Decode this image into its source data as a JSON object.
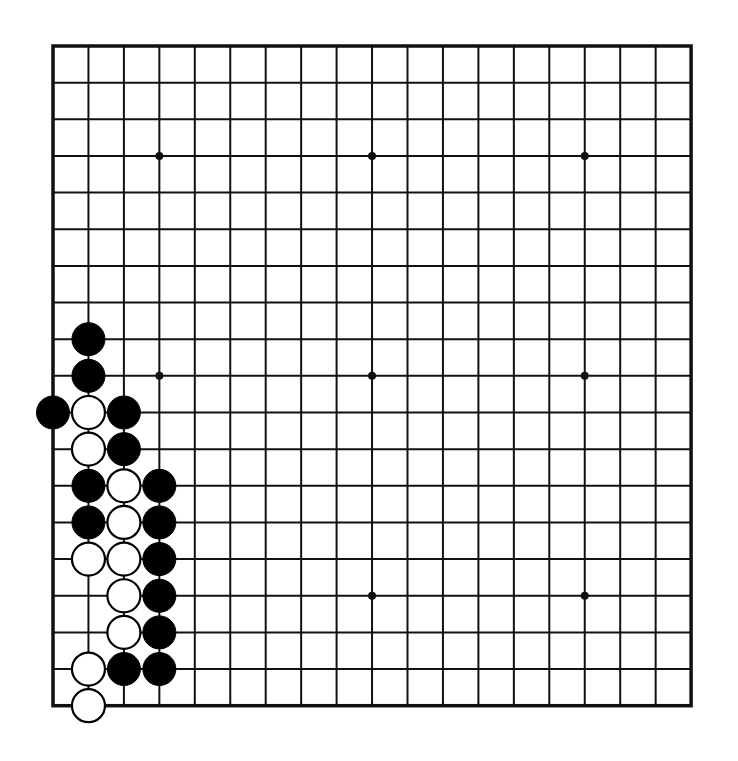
{
  "board": {
    "size": 19,
    "origin_x": 53,
    "origin_y": 46,
    "spacing_x": 35.45,
    "spacing_y": 36.65,
    "background": "#ffffff",
    "line_color": "#111111",
    "edge_width": 3.5,
    "line_width": 2,
    "stone_radius": 16.5,
    "star_radius": 4,
    "star_points": [
      [
        3,
        3
      ],
      [
        9,
        3
      ],
      [
        15,
        3
      ],
      [
        3,
        9
      ],
      [
        9,
        9
      ],
      [
        15,
        9
      ],
      [
        3,
        15
      ],
      [
        9,
        15
      ],
      [
        15,
        15
      ]
    ]
  },
  "stones": [
    {
      "color": "black",
      "col": 1,
      "row": 8
    },
    {
      "color": "black",
      "col": 1,
      "row": 9
    },
    {
      "color": "black",
      "col": 0,
      "row": 10
    },
    {
      "color": "white",
      "col": 1,
      "row": 10
    },
    {
      "color": "black",
      "col": 2,
      "row": 10
    },
    {
      "color": "white",
      "col": 1,
      "row": 11
    },
    {
      "color": "black",
      "col": 2,
      "row": 11
    },
    {
      "color": "black",
      "col": 1,
      "row": 12
    },
    {
      "color": "white",
      "col": 2,
      "row": 12
    },
    {
      "color": "black",
      "col": 3,
      "row": 12
    },
    {
      "color": "black",
      "col": 1,
      "row": 13
    },
    {
      "color": "white",
      "col": 2,
      "row": 13
    },
    {
      "color": "black",
      "col": 3,
      "row": 13
    },
    {
      "color": "white",
      "col": 1,
      "row": 14
    },
    {
      "color": "white",
      "col": 2,
      "row": 14
    },
    {
      "color": "black",
      "col": 3,
      "row": 14
    },
    {
      "color": "white",
      "col": 2,
      "row": 15
    },
    {
      "color": "black",
      "col": 3,
      "row": 15
    },
    {
      "color": "white",
      "col": 2,
      "row": 16
    },
    {
      "color": "black",
      "col": 3,
      "row": 16
    },
    {
      "color": "white",
      "col": 1,
      "row": 17
    },
    {
      "color": "black",
      "col": 2,
      "row": 17
    },
    {
      "color": "black",
      "col": 3,
      "row": 17
    },
    {
      "color": "white",
      "col": 1,
      "row": 18
    }
  ],
  "colors": {
    "black_stone": "#000000",
    "white_stone_fill": "#ffffff",
    "white_stone_stroke": "#000000"
  }
}
